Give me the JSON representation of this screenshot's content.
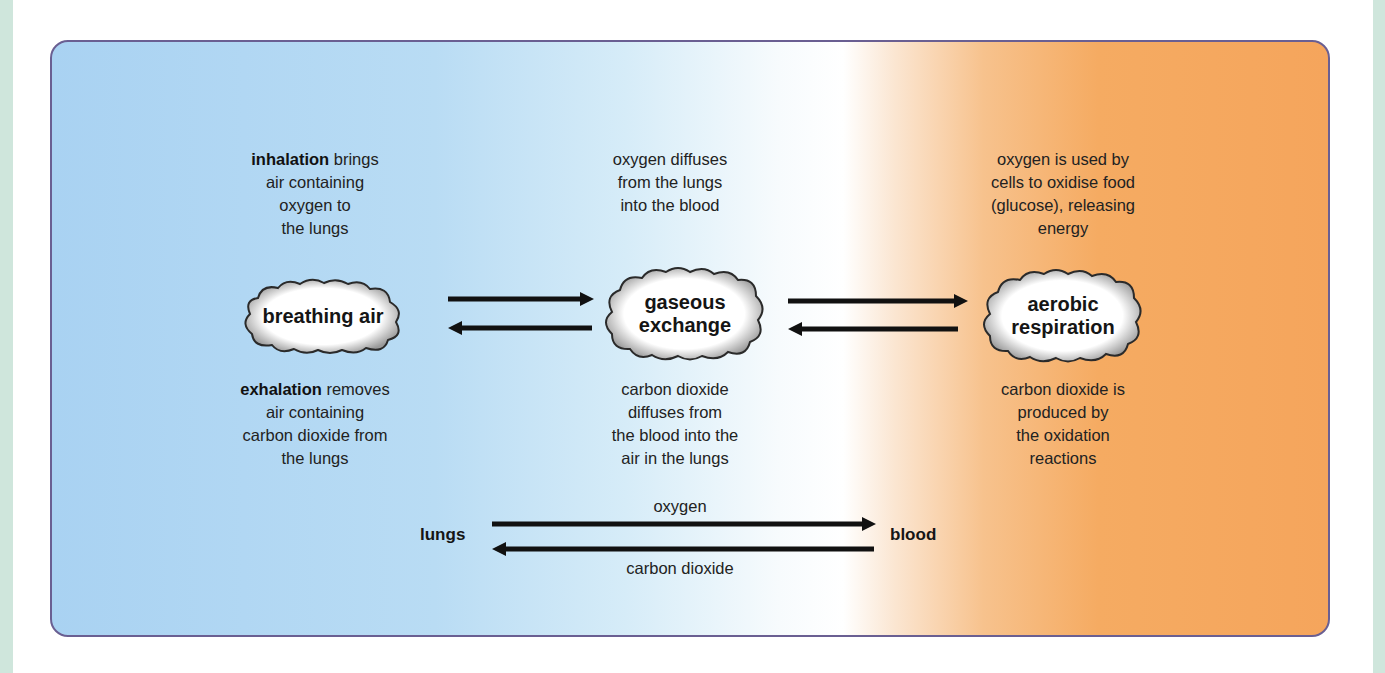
{
  "diagram": {
    "columns": [
      {
        "id": "breathing",
        "top_text_bold": "inhalation",
        "top_text_rest": " brings air containing oxygen to the lungs",
        "top_lines": [
          "brings",
          "air containing",
          "oxygen to",
          "the lungs"
        ],
        "cloud_label": "breathing air",
        "bottom_text_bold": "exhalation",
        "bottom_lines": [
          "removes",
          "air containing",
          "carbon dioxide from",
          "the lungs"
        ]
      },
      {
        "id": "gaseous",
        "top_lines": [
          "oxygen diffuses",
          "from the lungs",
          "into the blood"
        ],
        "cloud_label_lines": [
          "gaseous",
          "exchange"
        ],
        "bottom_lines": [
          "carbon dioxide",
          "diffuses from",
          "the blood into the",
          "air in the lungs"
        ]
      },
      {
        "id": "aerobic",
        "top_lines": [
          "oxygen is used by",
          "cells to oxidise food",
          "(glucose), releasing",
          "energy"
        ],
        "cloud_label_lines": [
          "aerobic",
          "respiration"
        ],
        "bottom_lines": [
          "carbon dioxide is",
          "produced by",
          "the oxidation",
          "reactions"
        ]
      }
    ],
    "exchange": {
      "left_label": "lungs",
      "right_label": "blood",
      "top_arrow_label": "oxygen",
      "bottom_arrow_label": "carbon dioxide"
    },
    "colors": {
      "left_blue": "#a9d2f2",
      "right_orange": "#f5a55c",
      "border": "#6a5f92",
      "side_strip": "#cfe6dc"
    }
  }
}
